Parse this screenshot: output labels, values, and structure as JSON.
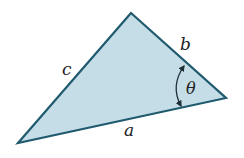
{
  "diagram": {
    "type": "triangle",
    "vertices": {
      "top": [
        131,
        13
      ],
      "bottom_left": [
        18,
        143
      ],
      "right": [
        226,
        98
      ]
    },
    "sides": {
      "a": {
        "label": "a",
        "between": [
          "bottom_left",
          "right"
        ]
      },
      "b": {
        "label": "b",
        "between": [
          "top",
          "right"
        ]
      },
      "c": {
        "label": "c",
        "between": [
          "bottom_left",
          "top"
        ]
      }
    },
    "angle": {
      "label": "θ",
      "at": "right",
      "between_sides": [
        "a",
        "b"
      ],
      "arrow": "double-headed arc"
    },
    "colors": {
      "fill": "#c5dde6",
      "stroke": "#1f5a6e",
      "label": "#222222"
    }
  }
}
